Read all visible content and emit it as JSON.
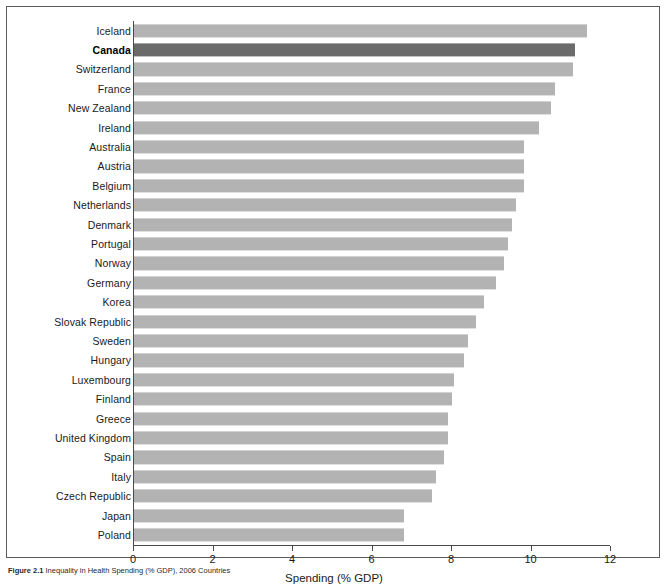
{
  "figure": {
    "caption_number": "Figure 2.1",
    "caption_text": "Inequality in Health Spending (% GDP), 2006 Countries",
    "frame_color": "#5b5b5b"
  },
  "colors": {
    "bar_default": "#b3b3b3",
    "bar_highlight": "#6b6b6b",
    "axis": "#4a4a4a",
    "text": "#1a1a1a"
  },
  "chart_data": {
    "type": "bar",
    "orientation": "horizontal",
    "title": "",
    "xlabel": "Spending (% GDP)",
    "ylabel": "",
    "xlim": [
      0,
      12
    ],
    "xticks": [
      0,
      2,
      4,
      6,
      8,
      10,
      12
    ],
    "xtick_labels": [
      "0",
      "2",
      "4",
      "6",
      "8",
      "10",
      "12"
    ],
    "grid": false,
    "legend": false,
    "highlight_category": "Canada",
    "categories": [
      "Iceland",
      "Canada",
      "Switzerland",
      "France",
      "New Zealand",
      "Ireland",
      "Australia",
      "Austria",
      "Belgium",
      "Netherlands",
      "Denmark",
      "Portugal",
      "Norway",
      "Germany",
      "Korea",
      "Slovak Republic",
      "Sweden",
      "Hungary",
      "Luxembourg",
      "Finland",
      "Greece",
      "United Kingdom",
      "Spain",
      "Italy",
      "Czech Republic",
      "Japan",
      "Poland"
    ],
    "values": [
      11.4,
      11.1,
      11.05,
      10.6,
      10.5,
      10.2,
      9.8,
      9.8,
      9.8,
      9.6,
      9.5,
      9.4,
      9.3,
      9.1,
      8.8,
      8.6,
      8.4,
      8.3,
      8.05,
      8.0,
      7.9,
      7.9,
      7.8,
      7.6,
      7.5,
      6.8,
      6.8
    ]
  }
}
